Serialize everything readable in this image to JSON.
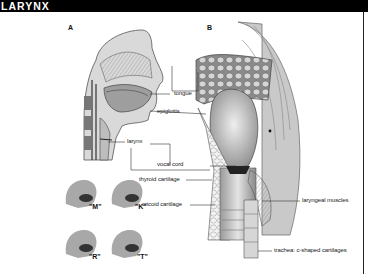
{
  "title": "LARYNX",
  "panels": {
    "a": {
      "letter": "A"
    },
    "b": {
      "letter": "B"
    }
  },
  "labels": {
    "tongue": "tongue",
    "epiglottis": "epiglottis",
    "larynx": "larynx",
    "vocal_cord": "vocal cord",
    "thyroid_cartilage": "thyroid cartilage",
    "cricoid_cartilage": "cricoid cartilage",
    "laryngeal_muscles": "laryngeal muscles",
    "trachea": "trachea: c-shaped cartilages"
  },
  "phonemes": [
    "\"M\"",
    "\"K\"",
    "\"R\"",
    "\"T\""
  ],
  "colors": {
    "title_bar": "#000000",
    "title_text": "#ffffff",
    "background": "#ffffff",
    "line": "#333333",
    "tissue_dark": "#555555",
    "tissue_light": "#cfcfcf"
  }
}
